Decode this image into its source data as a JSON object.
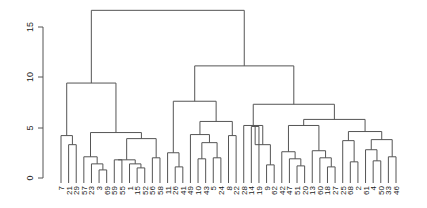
{
  "chart_data": {
    "type": "dendrogram",
    "title": "",
    "xlabel": "",
    "ylabel": "",
    "ylim": [
      0,
      16
    ],
    "yticks": [
      0,
      5,
      10,
      15
    ],
    "ytick_labels": [
      "0",
      "5",
      "10",
      "15"
    ],
    "grid": false,
    "leaf_labels": [
      "7",
      "21",
      "29",
      "57",
      "23",
      "3",
      "69",
      "59",
      "55",
      "1",
      "15",
      "52",
      "56",
      "58",
      "11",
      "26",
      "41",
      "49",
      "10",
      "43",
      "5",
      "24",
      "8",
      "22",
      "28",
      "14",
      "19",
      "9",
      "62",
      "42",
      "47",
      "51",
      "20",
      "13",
      "60",
      "18",
      "27",
      "25",
      "68",
      "2",
      "61",
      "4",
      "50",
      "33",
      "46"
    ],
    "merges": [
      {
        "height": 16.6,
        "description": "root: left cluster + right cluster"
      },
      {
        "height": 9.4,
        "description": "left cluster top merge"
      },
      {
        "height": 11.1,
        "description": "right cluster top merge"
      },
      {
        "height": 10.5,
        "description": "right-right subcluster merge"
      },
      {
        "height": 7.6,
        "description": "right-left subcluster merge"
      },
      {
        "height": 7.3,
        "description": "far-right subcluster merge"
      },
      {
        "height": 5.8,
        "description": "far-right group merge"
      },
      {
        "height": 5.6,
        "description": "group 10-43-5-24 merge"
      },
      {
        "height": 5.2,
        "description": "group 14-19-9 merge"
      },
      {
        "height": 4.5,
        "description": "group 23..58 merge"
      },
      {
        "height": 4.2,
        "description": "group 7-21-29 merge"
      }
    ],
    "colors": {
      "lines": "#555555",
      "axis": "#555555",
      "text": "#222222"
    }
  },
  "axis": {
    "ticks": [
      "0",
      "5",
      "10",
      "15"
    ]
  }
}
